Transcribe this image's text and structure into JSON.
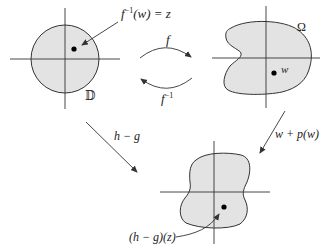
{
  "diagram": {
    "colors": {
      "fill": "#e3e3e3",
      "stroke": "#333333",
      "text": "#222222"
    },
    "disk": {
      "label": "𝔻",
      "point_annotation": {
        "fn": "f",
        "sup": "−1",
        "rest": "(w) = z"
      }
    },
    "omega": {
      "label": "Ω",
      "point_label": "w"
    },
    "arrow_f": {
      "label": "f"
    },
    "arrow_f_inv": {
      "fn": "f",
      "sup": "−1"
    },
    "arrow_h_minus_g": {
      "label": "h − g"
    },
    "arrow_w_plus_p": {
      "label": "w + p(w)"
    },
    "bottom_region": {
      "point_annotation": "(h − g)(z)"
    }
  }
}
